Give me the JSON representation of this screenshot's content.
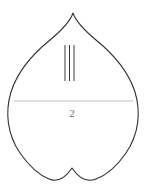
{
  "figure": {
    "background_color": "#ffffff",
    "width": 146,
    "height": 191,
    "outline": {
      "name": "leaf-outline",
      "shape": "cordate-heart-leaf",
      "stroke_color": "#2b2b2b",
      "fill_color": "#ffffff",
      "stroke_width": 1.05,
      "apex_point": [
        73,
        13
      ],
      "basal_notch_point": [
        72,
        168
      ],
      "leftmost_point": [
        9,
        103
      ],
      "rightmost_point": [
        137,
        103
      ],
      "lowest_point": [
        46,
        179
      ],
      "path": "M 73 13 C 70 22, 62 30, 50 40 C 34 53, 18 70, 11 92 C 5 112, 7 134, 20 153 C 29 166, 39 175, 49 179 C 59 183, 66 177, 72 168 C 78 177, 86 183, 96 179 C 107 175, 117 166, 126 153 C 139 134, 141 112, 135 92 C 128 70, 112 53, 96 40 C 84 30, 76 22, 73 13 Z"
    },
    "midline": {
      "name": "leaf-midline",
      "stroke_color": "#d9d9d9",
      "stroke_width": 0.75,
      "x1": 14,
      "y1": 101,
      "x2": 133,
      "y2": 101
    },
    "tally_marks": {
      "name": "vertical-tally-marks",
      "count": 3,
      "stroke_color": "#3a3a3a",
      "stroke_width": 1.0,
      "top_y": 45,
      "bottom_y": 81,
      "x_positions": [
        65,
        69.5,
        74
      ]
    },
    "label": {
      "name": "figure-number-label",
      "text": "2",
      "color": "#6e6e6e",
      "font_size": 11,
      "x": 72,
      "y": 117
    }
  }
}
